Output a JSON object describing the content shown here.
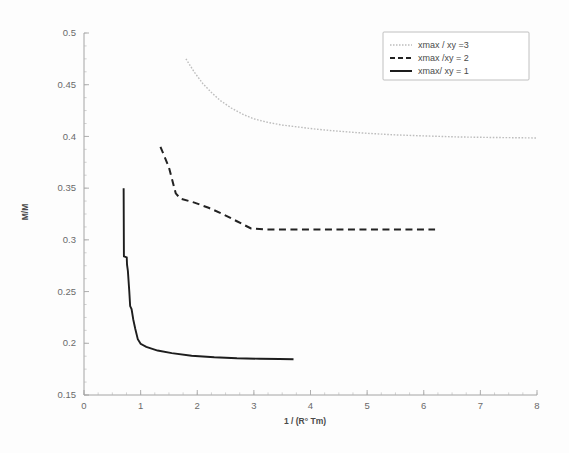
{
  "chart_data": {
    "type": "line",
    "title": "",
    "xlabel": "1 / (R° Tm)",
    "ylabel": "M/M",
    "xlim": [
      0,
      8
    ],
    "ylim": [
      0.15,
      0.5
    ],
    "xticks": [
      "0",
      "1",
      "2",
      "3",
      "4",
      "5",
      "6",
      "7",
      "8"
    ],
    "yticks": [
      "0.15",
      "0.2",
      "0.25",
      "0.3",
      "0.35",
      "0.4",
      "0.45",
      "0.5"
    ],
    "grid": false,
    "legend_position": "top-right",
    "series": [
      {
        "name": "xmax / xy =3",
        "style": "dotted",
        "color": "#bdbdbd",
        "points": [
          [
            1.8,
            0.475
          ],
          [
            1.95,
            0.462
          ],
          [
            2.1,
            0.451
          ],
          [
            2.25,
            0.4425
          ],
          [
            2.4,
            0.435
          ],
          [
            2.6,
            0.4275
          ],
          [
            2.8,
            0.4215
          ],
          [
            3.0,
            0.417
          ],
          [
            3.25,
            0.4135
          ],
          [
            3.5,
            0.411
          ],
          [
            3.8,
            0.409
          ],
          [
            4.1,
            0.407
          ],
          [
            4.5,
            0.405
          ],
          [
            5.0,
            0.403
          ],
          [
            5.5,
            0.4015
          ],
          [
            6.0,
            0.4005
          ],
          [
            6.6,
            0.3995
          ],
          [
            7.2,
            0.399
          ],
          [
            8.0,
            0.3985
          ]
        ]
      },
      {
        "name": "xmax /xy = 2",
        "style": "dashed",
        "color": "#222222",
        "points": [
          [
            1.35,
            0.39
          ],
          [
            1.5,
            0.37
          ],
          [
            1.62,
            0.345
          ],
          [
            1.7,
            0.34
          ],
          [
            1.95,
            0.336
          ],
          [
            2.2,
            0.331
          ],
          [
            2.45,
            0.325
          ],
          [
            2.7,
            0.318
          ],
          [
            2.95,
            0.311
          ],
          [
            3.2,
            0.31
          ],
          [
            3.8,
            0.31
          ],
          [
            4.5,
            0.31
          ],
          [
            5.3,
            0.31
          ],
          [
            6.2,
            0.31
          ]
        ]
      },
      {
        "name": "xmax/ xy = 1",
        "style": "solid",
        "color": "#1d1d1d",
        "points": [
          [
            0.7,
            0.35
          ],
          [
            0.705,
            0.284
          ],
          [
            0.755,
            0.283
          ],
          [
            0.76,
            0.276
          ],
          [
            0.775,
            0.27
          ],
          [
            0.8,
            0.25
          ],
          [
            0.815,
            0.236
          ],
          [
            0.84,
            0.233
          ],
          [
            0.87,
            0.223
          ],
          [
            0.905,
            0.214
          ],
          [
            0.95,
            0.204
          ],
          [
            1.0,
            0.1995
          ],
          [
            1.1,
            0.1965
          ],
          [
            1.3,
            0.193
          ],
          [
            1.55,
            0.1905
          ],
          [
            1.9,
            0.188
          ],
          [
            2.3,
            0.1865
          ],
          [
            2.7,
            0.1855
          ],
          [
            3.1,
            0.185
          ],
          [
            3.45,
            0.1848
          ],
          [
            3.7,
            0.1845
          ]
        ]
      }
    ]
  },
  "legend": {
    "entries": [
      {
        "label": "xmax / xy =3"
      },
      {
        "label": "xmax /xy = 2"
      },
      {
        "label": "xmax/ xy = 1"
      }
    ]
  }
}
